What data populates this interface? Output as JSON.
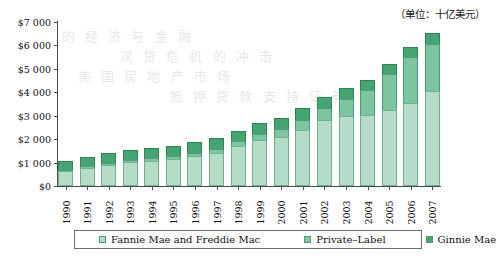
{
  "unit_caption": "（单位：十亿美元）",
  "legend": {
    "items": [
      {
        "label": "Fannie Mae and Freddie Mac",
        "color": "#b4dcc6"
      },
      {
        "label": "Private–Label",
        "color": "#7dc4a0"
      },
      {
        "label": "Ginnie Mae",
        "color": "#46a473"
      }
    ]
  },
  "axis": {
    "y_ticks": [
      "$0",
      "$1 000",
      "$2 000",
      "$3 000",
      "$4 000",
      "$5 000",
      "$6 000",
      "$7 000"
    ]
  },
  "bleed_text": {
    "l1": "的 经 济 与 金 融",
    "l2": "次 贷 危 机 的 冲 击",
    "l3": "美 国 房 地 产 市 场",
    "l4": "抵 押 贷 款 支 持 证 券"
  },
  "chart_data": {
    "type": "bar",
    "stacked": true,
    "title": "",
    "subtitle": "",
    "xlabel": "",
    "ylabel": "",
    "unit": "十亿美元 (billions of USD)",
    "ylim": [
      0,
      7000
    ],
    "ytick_values": [
      0,
      1000,
      2000,
      3000,
      4000,
      5000,
      6000,
      7000
    ],
    "grid": false,
    "legend_position": "bottom",
    "categories": [
      "1990",
      "1991",
      "1992",
      "1993",
      "1994",
      "1995",
      "1996",
      "1997",
      "1998",
      "1999",
      "2000",
      "2001",
      "2002",
      "2003",
      "2004",
      "2005",
      "2006",
      "2007"
    ],
    "series": [
      {
        "name": "Fannie Mae and Freddie Mac",
        "color": "#b4dcc6",
        "values": [
          620,
          760,
          900,
          1010,
          1070,
          1140,
          1260,
          1400,
          1700,
          1950,
          2100,
          2400,
          2800,
          2970,
          3010,
          3240,
          3540,
          4050
        ]
      },
      {
        "name": "Private–Label",
        "color": "#7dc4a0",
        "values": [
          60,
          80,
          100,
          120,
          130,
          140,
          160,
          180,
          210,
          270,
          320,
          420,
          540,
          740,
          1080,
          1550,
          1980,
          2020
        ]
      },
      {
        "name": "Ginnie Mae",
        "color": "#46a473",
        "values": [
          400,
          410,
          420,
          420,
          420,
          430,
          440,
          450,
          460,
          470,
          480,
          490,
          450,
          470,
          450,
          430,
          420,
          480
        ]
      }
    ],
    "totals": [
      1080,
      1250,
      1420,
      1550,
      1620,
      1710,
      1860,
      2030,
      2370,
      2690,
      2900,
      3310,
      3790,
      4180,
      4540,
      5220,
      5940,
      6550
    ]
  }
}
